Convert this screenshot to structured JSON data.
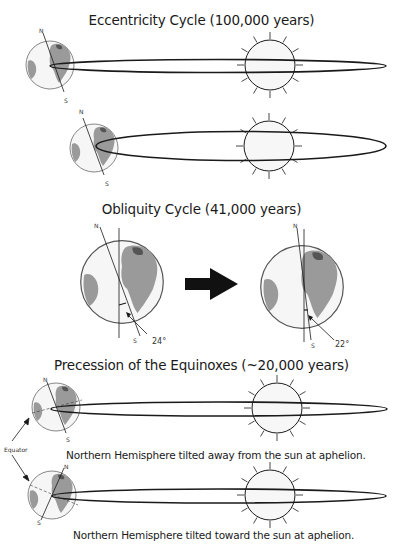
{
  "sections": {
    "eccentricity": {
      "title": "Eccentricity Cycle (100,000 years)",
      "panels": [
        {
          "earth_label_n": "N",
          "earth_label_s": "S",
          "orbit": "very elongated / nearly flat ellipse"
        },
        {
          "earth_label_n": "N",
          "earth_label_s": "S",
          "orbit": "wider, more circular ellipse"
        }
      ]
    },
    "obliquity": {
      "title": "Obliquity Cycle (41,000 years)",
      "left": {
        "earth_label_n": "N",
        "earth_label_s": "S",
        "angle_label": "24°",
        "angle_deg": 24
      },
      "right": {
        "earth_label_n": "N",
        "earth_label_s": "S",
        "angle_label": "22°",
        "angle_deg": 22
      },
      "arrow": "right-arrow"
    },
    "precession": {
      "title": "Precession of the Equinoxes (~20,000 years)",
      "equator_label": "Equator",
      "panels": [
        {
          "earth_label_n": "N",
          "earth_label_s": "S",
          "caption": "Northern Hemisphere tilted away from the sun at aphelion."
        },
        {
          "earth_label_n": "N",
          "earth_label_s": "S",
          "caption": "Northern Hemisphere tilted toward the sun at aphelion."
        }
      ]
    }
  },
  "colors": {
    "line": "#1a1a1a",
    "land": "#9a9a9a",
    "globe": "#f4f4f4"
  }
}
